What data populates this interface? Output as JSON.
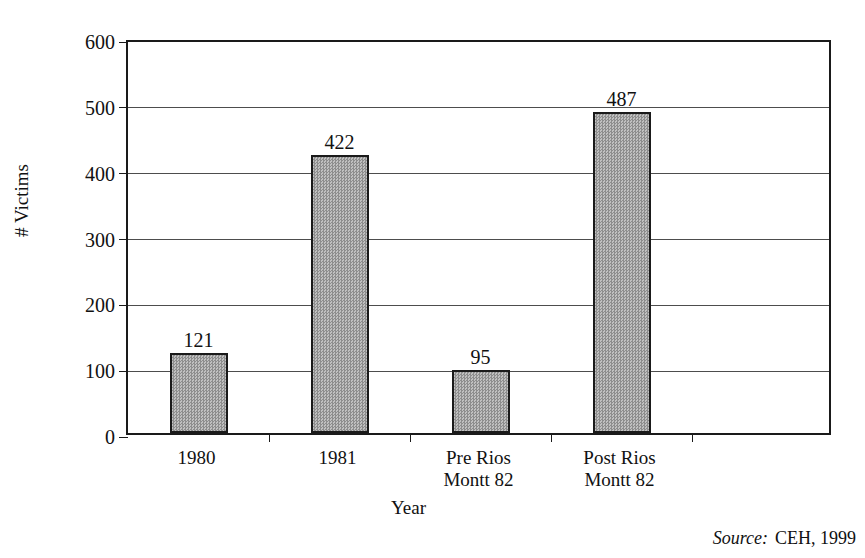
{
  "chart_data": {
    "type": "bar",
    "title": "",
    "subtitle": "",
    "categories": [
      "1980",
      "1981",
      "Pre Rios\nMontt 82",
      "Post Rios\nMontt 82"
    ],
    "values": [
      121,
      422,
      95,
      487
    ],
    "value_labels": [
      "121",
      "422",
      "95",
      "487"
    ],
    "xlabel": "Year",
    "ylabel": "# Victims",
    "ylim": [
      0,
      600
    ],
    "ytick_values": [
      0,
      100,
      200,
      300,
      400,
      500,
      600
    ],
    "ytick_labels": [
      "0",
      "100",
      "200",
      "300",
      "400",
      "500",
      "600"
    ],
    "grid": "horizontal",
    "legend": "none",
    "bar_fill_color": "#a0a0a0",
    "bar_fill_pattern": "checkerboard-dither",
    "bar_border_color": "#1a1a1a",
    "plot_background": "#ffffff",
    "gridline_color": "#4d4d4d",
    "axis_color": "#1a1a1a"
  },
  "annotations": {
    "source_word": "Source:",
    "source_text": "CEH, 1999"
  }
}
